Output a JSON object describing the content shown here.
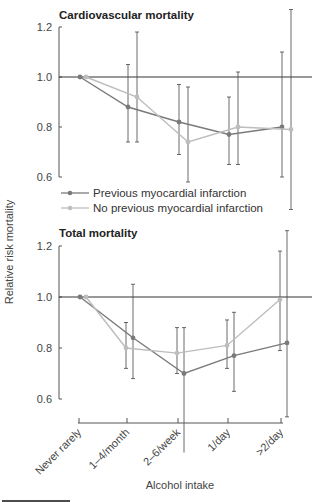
{
  "chart_data": [
    {
      "type": "line",
      "title": "Cardiovascular mortality",
      "xlabel": "Alcohol intake",
      "ylabel": "Relative risk mortality",
      "ylim": [
        0.6,
        1.2
      ],
      "yticks": [
        "0.6",
        "0.8",
        "1.0",
        "1.2"
      ],
      "reference_line": 1.0,
      "grid": false,
      "legend_position": "bottom-left inside",
      "categories": [
        "Never rarely",
        "1–4/month",
        "2–6/week",
        "1/day",
        ">2/day"
      ],
      "series": [
        {
          "name": "Previous myocardial infarction",
          "color": "#7a7a7a",
          "values": [
            1.0,
            0.88,
            0.82,
            0.77,
            0.8
          ],
          "ci_low": [
            1.0,
            0.74,
            0.69,
            0.65,
            0.6
          ],
          "ci_high": [
            1.0,
            1.05,
            0.97,
            0.92,
            1.1
          ]
        },
        {
          "name": "No previous myocardial infarction",
          "color": "#bdbdbd",
          "values": [
            1.0,
            0.92,
            0.74,
            0.8,
            0.79
          ],
          "ci_low": [
            1.0,
            0.74,
            0.58,
            0.65,
            0.47
          ],
          "ci_high": [
            1.0,
            1.18,
            0.96,
            1.02,
            1.27
          ]
        }
      ]
    },
    {
      "type": "line",
      "title": "Total mortality",
      "xlabel": "Alcohol intake",
      "ylabel": "Relative risk mortality",
      "ylim": [
        0.6,
        1.2
      ],
      "yticks": [
        "0.6",
        "0.8",
        "1.0",
        "1.2"
      ],
      "reference_line": 1.0,
      "grid": false,
      "categories": [
        "Never rarely",
        "1–4/month",
        "2–6/week",
        "1/day",
        ">2/day"
      ],
      "series": [
        {
          "name": "Previous myocardial infarction",
          "color": "#7a7a7a",
          "values": [
            1.0,
            0.84,
            0.7,
            0.77,
            0.82
          ],
          "ci_low": [
            1.0,
            0.68,
            0.39,
            0.63,
            0.53
          ],
          "ci_high": [
            1.0,
            1.05,
            0.88,
            0.94,
            1.26
          ]
        },
        {
          "name": "No previous myocardial infarction",
          "color": "#bdbdbd",
          "values": [
            1.0,
            0.8,
            0.78,
            0.81,
            0.99
          ],
          "ci_low": [
            1.0,
            0.72,
            0.7,
            0.72,
            0.79
          ],
          "ci_high": [
            1.0,
            0.9,
            0.88,
            0.91,
            1.18
          ]
        }
      ]
    }
  ],
  "labels": {
    "top_title": "Cardiovascular mortality",
    "bottom_title": "Total mortality",
    "y_axis": "Relative risk mortality",
    "x_axis": "Alcohol intake",
    "legend_prev": "Previous myocardial infarction",
    "legend_noprev": "No previous myocardial infarction",
    "ticks_y": [
      "1.2",
      "1.0",
      "0.8",
      "0.6"
    ],
    "ticks_x": [
      "Never rarely",
      "1–4/month",
      "2–6/week",
      "1/day",
      ">2/day"
    ]
  }
}
